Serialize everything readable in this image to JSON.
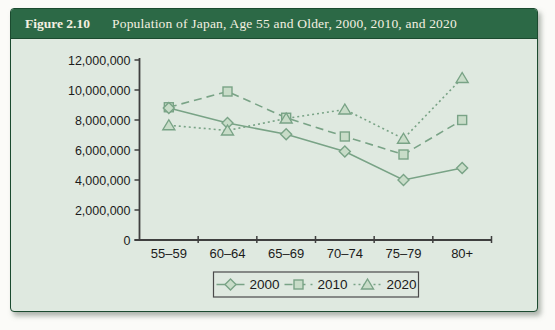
{
  "figure": {
    "label": "Figure 2.10",
    "title": "Population of Japan, Age 55 and Older, 2000, 2010, and 2020"
  },
  "colors": {
    "header_bg": "#2c6946",
    "header_text": "#f4f0e1",
    "panel_bg": "#dfe9e0",
    "panel_border": "#1b4a2f",
    "series_stroke": "#79a386",
    "marker_fill": "#c8dcc8",
    "axis": "#3f3f3f",
    "text": "#1b1b1b",
    "legend_border": "#4a4a4a"
  },
  "chart_data": {
    "type": "line",
    "title": "Population of Japan, Age 55 and Older, 2000, 2010, and 2020",
    "categories": [
      "55–59",
      "60–64",
      "65–69",
      "70–74",
      "75–79",
      "80+"
    ],
    "series": [
      {
        "name": "2000",
        "marker": "diamond",
        "line_style": "solid",
        "values": [
          8800000,
          7800000,
          7050000,
          5900000,
          4000000,
          4800000
        ]
      },
      {
        "name": "2010",
        "marker": "square",
        "line_style": "dashed",
        "values": [
          8850000,
          9900000,
          8150000,
          6900000,
          5700000,
          8000000
        ]
      },
      {
        "name": "2020",
        "marker": "triangle",
        "line_style": "dotted",
        "values": [
          7650000,
          7300000,
          8100000,
          8700000,
          6750000,
          10800000
        ]
      }
    ],
    "xlabel": "",
    "ylabel": "",
    "ylim": [
      0,
      12000000
    ],
    "ytick_step": 2000000,
    "ytick_labels": [
      "0",
      "2,000,000",
      "4,000,000",
      "6,000,000",
      "8,000,000",
      "10,000,000",
      "12,000,000"
    ],
    "grid": false,
    "legend_position": "bottom",
    "legend_entries": [
      "2000",
      "2010",
      "2020"
    ]
  }
}
